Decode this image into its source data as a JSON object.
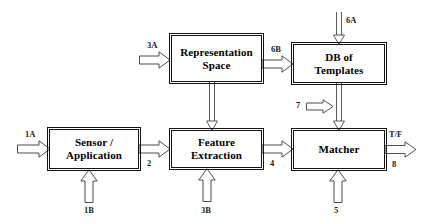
{
  "diagram": {
    "background": "#ffffff",
    "box_border_color": "#141414",
    "arrow_stroke_color": "#4d4d4d",
    "blocks": [
      {
        "id": "sensor",
        "label": "Sensor /\nApplication"
      },
      {
        "id": "representation",
        "label": "Representation\nSpace"
      },
      {
        "id": "feature",
        "label": "Feature\nExtraction"
      },
      {
        "id": "database",
        "label": "DB of\nTemplates"
      },
      {
        "id": "matcher",
        "label": "Matcher"
      }
    ],
    "arrow_labels": {
      "input_1a": "1A",
      "input_1b": "1B",
      "sensor_to_feature": "2",
      "into_representation_3a": "3A",
      "into_feature_3b": "3B",
      "feature_to_matcher": "4",
      "into_matcher_5": "5",
      "into_database_6a": "6A",
      "representation_to_database_6b": "6B",
      "into_matcher_7": "7",
      "output_decision": "T/F",
      "output_number": "8"
    }
  }
}
